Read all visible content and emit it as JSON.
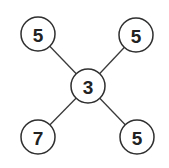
{
  "diagram": {
    "type": "star-graph",
    "nodes": [
      {
        "id": "center",
        "label": "3",
        "cx": 88,
        "cy": 86
      },
      {
        "id": "top-left",
        "label": "5",
        "cx": 38,
        "cy": 34
      },
      {
        "id": "top-right",
        "label": "5",
        "cx": 136,
        "cy": 35
      },
      {
        "id": "bottom-left",
        "label": "7",
        "cx": 38,
        "cy": 137
      },
      {
        "id": "bottom-right",
        "label": "5",
        "cx": 137,
        "cy": 137
      }
    ],
    "edges": [
      {
        "from": "center",
        "to": "top-left"
      },
      {
        "from": "center",
        "to": "top-right"
      },
      {
        "from": "center",
        "to": "bottom-left"
      },
      {
        "from": "center",
        "to": "bottom-right"
      }
    ],
    "node_radius": 17,
    "colors": {
      "stroke": "#2f2f2f",
      "fill": "#ffffff",
      "text": "#222222"
    }
  }
}
